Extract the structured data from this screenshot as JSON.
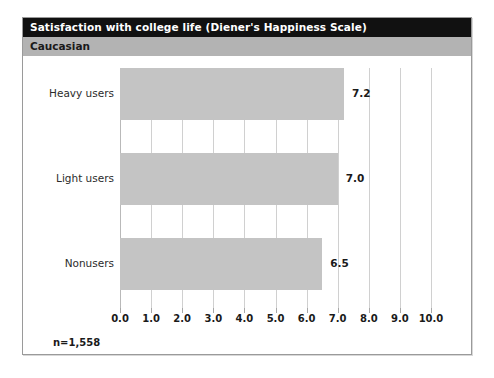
{
  "panel": {
    "title": "Satisfaction with college life (Diener's Happiness Scale)",
    "subtitle": "Caucasian",
    "sample_size": "n=1,558",
    "title_bar_color": "#111111",
    "subtitle_bar_color": "#b3b3b3",
    "bar_color": "#c4c4c4",
    "gridline_color": "#d0d0d0",
    "border_color": "#9a9a9a"
  },
  "chart_data": {
    "type": "bar",
    "orientation": "horizontal",
    "title": "Satisfaction with college life (Diener's Happiness Scale)",
    "subtitle": "Caucasian",
    "categories": [
      "Heavy users",
      "Light users",
      "Nonusers"
    ],
    "values": [
      7.2,
      7.0,
      6.5
    ],
    "data_labels": [
      "7.2",
      "7.0",
      "6.5"
    ],
    "xlabel": "",
    "ylabel": "",
    "xlim": [
      0.0,
      10.0
    ],
    "xticks": [
      0.0,
      1.0,
      2.0,
      3.0,
      4.0,
      5.0,
      6.0,
      7.0,
      8.0,
      9.0,
      10.0
    ],
    "xticklabels": [
      "0.0",
      "1.0",
      "2.0",
      "3.0",
      "4.0",
      "5.0",
      "6.0",
      "7.0",
      "8.0",
      "9.0",
      "10.0"
    ],
    "grid": true,
    "legend": false,
    "annotation": "n=1,558"
  }
}
